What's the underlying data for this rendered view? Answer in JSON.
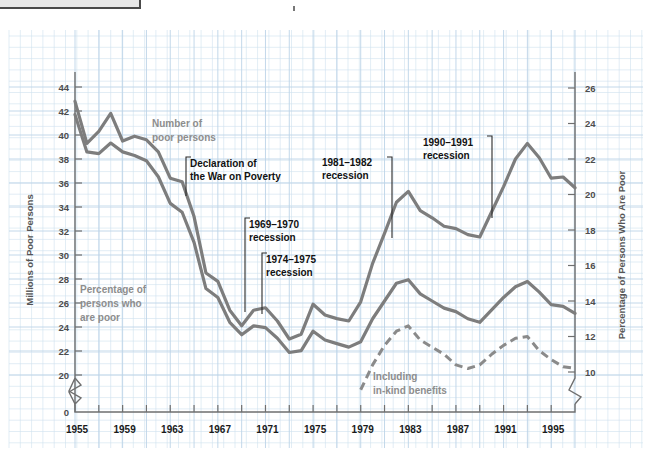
{
  "window": {
    "titlebar_stub": "",
    "caret": ""
  },
  "chart_data": {
    "type": "line",
    "title": "",
    "xlabel": "",
    "ylabel": "Millions of Poor Persons",
    "y2label": "Percentage of Persons Who Are Poor",
    "grid": true,
    "legend_position": "inline-annotations",
    "xlim": [
      1955,
      1997
    ],
    "ylim": [
      0,
      45
    ],
    "y2lim": [
      0,
      27
    ],
    "y_axis_break": true,
    "y2_axis_break": true,
    "xticks": [
      1955,
      1959,
      1963,
      1967,
      1971,
      1975,
      1979,
      1983,
      1987,
      1991,
      1995
    ],
    "xticklabels": [
      "1955",
      "1959",
      "1963",
      "1967",
      "1971",
      "1975",
      "1979",
      "1983",
      "1987",
      "1991",
      "1995"
    ],
    "xtick_minor_step": 2,
    "yticks": [
      0,
      20,
      22,
      24,
      26,
      28,
      30,
      32,
      34,
      36,
      38,
      40,
      42,
      44
    ],
    "yticklabels": [
      "0",
      "20",
      "22",
      "24",
      "26",
      "28",
      "30",
      "32",
      "34",
      "36",
      "38",
      "40",
      "42",
      "44"
    ],
    "y2ticks": [
      10,
      12,
      14,
      16,
      18,
      20,
      22,
      24,
      26
    ],
    "y2ticklabels": [
      "10",
      "12",
      "14",
      "16",
      "18",
      "20",
      "22",
      "24",
      "26"
    ],
    "series": [
      {
        "name": "Number of poor persons",
        "axis": "left",
        "style": "solid",
        "color": "#7d7d7d",
        "units": "millions",
        "x": [
          1955,
          1956,
          1957,
          1958,
          1959,
          1960,
          1961,
          1962,
          1963,
          1964,
          1965,
          1966,
          1967,
          1968,
          1969,
          1970,
          1971,
          1972,
          1973,
          1974,
          1975,
          1976,
          1977,
          1978,
          1979,
          1980,
          1981,
          1982,
          1983,
          1984,
          1985,
          1986,
          1987,
          1988,
          1989,
          1990,
          1991,
          1992,
          1993,
          1994,
          1995,
          1996,
          1997
        ],
        "values": [
          42.8,
          39.3,
          40.3,
          41.8,
          39.5,
          39.9,
          39.6,
          38.6,
          36.4,
          36.1,
          33.2,
          28.5,
          27.8,
          25.4,
          24.1,
          25.4,
          25.6,
          24.5,
          23.0,
          23.4,
          25.9,
          25.0,
          24.7,
          24.5,
          26.1,
          29.3,
          31.8,
          34.4,
          35.3,
          33.7,
          33.1,
          32.4,
          32.2,
          31.7,
          31.5,
          33.6,
          35.7,
          38.0,
          39.3,
          38.1,
          36.4,
          36.5,
          35.6
        ]
      },
      {
        "name": "Percentage of persons who are poor",
        "axis": "right",
        "style": "solid",
        "color": "#7d7d7d",
        "units": "percent",
        "x": [
          1955,
          1956,
          1957,
          1958,
          1959,
          1960,
          1961,
          1962,
          1963,
          1964,
          1965,
          1966,
          1967,
          1968,
          1969,
          1970,
          1971,
          1972,
          1973,
          1974,
          1975,
          1976,
          1977,
          1978,
          1979,
          1980,
          1981,
          1982,
          1983,
          1984,
          1985,
          1986,
          1987,
          1988,
          1989,
          1990,
          1991,
          1992,
          1993,
          1994,
          1995,
          1996,
          1997
        ],
        "values": [
          24.5,
          22.4,
          22.3,
          22.9,
          22.4,
          22.2,
          21.9,
          21.0,
          19.5,
          19.0,
          17.3,
          14.7,
          14.2,
          12.8,
          12.1,
          12.6,
          12.5,
          11.9,
          11.1,
          11.2,
          12.3,
          11.8,
          11.6,
          11.4,
          11.7,
          13.0,
          14.0,
          15.0,
          15.2,
          14.4,
          14.0,
          13.6,
          13.4,
          13.0,
          12.8,
          13.5,
          14.2,
          14.8,
          15.1,
          14.5,
          13.8,
          13.7,
          13.3
        ]
      },
      {
        "name": "Including in-kind benefits",
        "axis": "right",
        "style": "dashed",
        "color": "#8a8a8a",
        "units": "percent",
        "x": [
          1979,
          1980,
          1981,
          1982,
          1983,
          1984,
          1985,
          1986,
          1987,
          1988,
          1989,
          1990,
          1991,
          1992,
          1993,
          1994,
          1995,
          1996,
          1997
        ],
        "values": [
          9.0,
          10.4,
          11.5,
          12.3,
          12.6,
          11.8,
          11.4,
          11.0,
          10.4,
          10.2,
          10.4,
          11.0,
          11.5,
          11.9,
          12.0,
          11.2,
          10.7,
          10.3,
          10.2
        ]
      }
    ],
    "series_labels": [
      {
        "name": "number-of-poor-persons-label",
        "line1": "Number of",
        "line2": "poor persons"
      },
      {
        "name": "percentage-poor-label",
        "line1": "Percentage of",
        "line2": "persons who",
        "line3": "are poor"
      },
      {
        "name": "in-kind-benefits-label",
        "line1": "Including",
        "line2": "in-kind benefits"
      }
    ],
    "annotations": [
      {
        "name": "declaration-war-on-poverty",
        "line1": "Declaration of",
        "line2": "the War on Poverty",
        "year": 1964
      },
      {
        "name": "recession-1969-1970",
        "line1": "1969–1970",
        "line2": "recession",
        "year": 1969
      },
      {
        "name": "recession-1974-1975",
        "line1": "1974–1975",
        "line2": "recession",
        "year": 1974
      },
      {
        "name": "recession-1981-1982",
        "line1": "1981–1982",
        "line2": "recession",
        "year": 1981
      },
      {
        "name": "recession-1990-1991",
        "line1": "1990–1991",
        "line2": "recession",
        "year": 1990
      }
    ]
  },
  "colors": {
    "grid_minor": "#cfe0ef",
    "grid_major": "#bcd4e8",
    "axis": "#6f6f6f",
    "series_gray": "#7d7d7d",
    "annotation_black": "#111111",
    "label_gray": "#8d8d8d",
    "background": "#ffffff"
  }
}
